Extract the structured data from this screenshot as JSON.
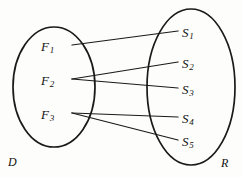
{
  "diagram": {
    "type": "mapping-diagram",
    "title": "",
    "stroke_color": "#1a1a1a",
    "background_color": "#fdfdfb",
    "domain_set": {
      "label": "D",
      "label_x": 8,
      "label_y": 156,
      "ellipse": {
        "cx": 54,
        "cy": 87,
        "rx": 41,
        "ry": 60
      },
      "elements": [
        {
          "id": "F1",
          "base": "F",
          "sub": "1",
          "x": 41,
          "y": 40,
          "anchor_x": 72,
          "anchor_y": 45
        },
        {
          "id": "F2",
          "base": "F",
          "sub": "2",
          "x": 41,
          "y": 74,
          "anchor_x": 72,
          "anchor_y": 79
        },
        {
          "id": "F3",
          "base": "F",
          "sub": "3",
          "x": 41,
          "y": 108,
          "anchor_x": 72,
          "anchor_y": 113
        }
      ]
    },
    "range_set": {
      "label": "R",
      "label_x": 221,
      "label_y": 157,
      "ellipse": {
        "cx": 191,
        "cy": 87,
        "rx": 44,
        "ry": 78
      },
      "elements": [
        {
          "id": "S1",
          "base": "S",
          "sub": "1",
          "x": 182,
          "y": 26,
          "anchor_x": 178,
          "anchor_y": 31
        },
        {
          "id": "S2",
          "base": "S",
          "sub": "2",
          "x": 182,
          "y": 57,
          "anchor_x": 178,
          "anchor_y": 62
        },
        {
          "id": "S3",
          "base": "S",
          "sub": "3",
          "x": 182,
          "y": 83,
          "anchor_x": 178,
          "anchor_y": 88
        },
        {
          "id": "S4",
          "base": "S",
          "sub": "4",
          "x": 182,
          "y": 112,
          "anchor_x": 178,
          "anchor_y": 117
        },
        {
          "id": "S5",
          "base": "S",
          "sub": "5",
          "x": 182,
          "y": 135,
          "anchor_x": 178,
          "anchor_y": 140
        }
      ]
    },
    "edges": [
      {
        "from": "F1",
        "to": "S1",
        "x1": 72,
        "y1": 45,
        "x2": 178,
        "y2": 31
      },
      {
        "from": "F2",
        "to": "S2",
        "x1": 72,
        "y1": 79,
        "x2": 178,
        "y2": 62
      },
      {
        "from": "F2",
        "to": "S3",
        "x1": 72,
        "y1": 79,
        "x2": 178,
        "y2": 88
      },
      {
        "from": "F3",
        "to": "S4",
        "x1": 72,
        "y1": 113,
        "x2": 178,
        "y2": 117
      },
      {
        "from": "F3",
        "to": "S5",
        "x1": 72,
        "y1": 113,
        "x2": 178,
        "y2": 140
      }
    ]
  }
}
